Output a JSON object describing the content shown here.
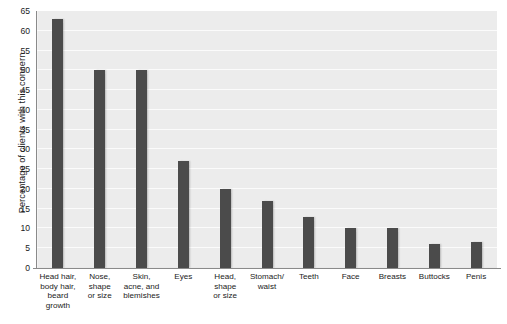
{
  "chart_data": {
    "type": "bar",
    "title": "",
    "xlabel": "",
    "ylabel": "Percentage of clients with this concern",
    "ylim": [
      0,
      65
    ],
    "yticks": [
      0,
      5,
      10,
      15,
      20,
      25,
      30,
      35,
      40,
      45,
      50,
      55,
      60,
      65
    ],
    "grid": true,
    "legend": false,
    "orientation": "vertical",
    "bar_color": "#4b4b4b",
    "plot_background": "#ececec",
    "gridline_color": "#fbfbfb",
    "categories": [
      "Head hair, body hair, beard growth",
      "Nose, shape or size",
      "Skin, acne, and blemishes",
      "Eyes",
      "Head, shape or size",
      "Stomach/ waist",
      "Teeth",
      "Face",
      "Breasts",
      "Buttocks",
      "Penis"
    ],
    "category_lines": [
      [
        "Head hair,",
        "body hair,",
        "beard",
        "growth"
      ],
      [
        "Nose,",
        "shape",
        "or size"
      ],
      [
        "Skin,",
        "acne, and",
        "blemishes"
      ],
      [
        "Eyes"
      ],
      [
        "Head,",
        "shape",
        "or size"
      ],
      [
        "Stomach/",
        "waist"
      ],
      [
        "Teeth"
      ],
      [
        "Face"
      ],
      [
        "Breasts"
      ],
      [
        "Buttocks"
      ],
      [
        "Penis"
      ]
    ],
    "values": [
      63,
      50,
      50,
      27,
      20,
      17,
      13,
      10,
      10,
      6,
      6.5
    ]
  }
}
